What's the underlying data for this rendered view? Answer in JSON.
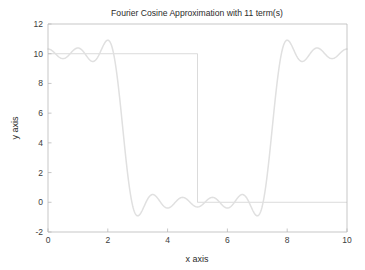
{
  "chart_data": {
    "type": "line",
    "title": "Fourier Cosine Approximation with 11 term(s)",
    "xlabel": "x axis",
    "ylabel": "y axis",
    "xlim": [
      0,
      10
    ],
    "ylim": [
      -2,
      12
    ],
    "xticks": [
      0,
      2,
      4,
      6,
      8,
      10
    ],
    "xtick_labels": [
      "0",
      "2",
      "4",
      "6",
      "8",
      "10"
    ],
    "yticks": [
      -2,
      0,
      2,
      4,
      6,
      8,
      10,
      12
    ],
    "ytick_labels": [
      "-2",
      "0",
      "2",
      "4",
      "6",
      "8",
      "10",
      "12"
    ],
    "grid": false,
    "legend": null,
    "colors": {
      "square_wave": "#d2d2d2",
      "fourier": "#e0e0e0",
      "axis": "#b9b9b9",
      "text": "#2b2b2b",
      "background": "#ffffff"
    },
    "series": [
      {
        "name": "square wave",
        "type": "step",
        "amplitude": 10,
        "baseline": 0,
        "jump_x": 5,
        "x": [
          0,
          5,
          5,
          10
        ],
        "values": [
          10,
          10,
          0,
          0
        ]
      },
      {
        "name": "Fourier cosine approximation",
        "type": "fourier_cosine",
        "n_terms": 11,
        "half_period": 5,
        "mean": 5,
        "amplitude": 10,
        "description": "Truncated cosine series approximating a square wave of height 10 on 0<x<5 and 0 on 5<x<10",
        "x_start": 0,
        "x_end": 10,
        "samples": 600,
        "observed_points": [
          {
            "x": 0.0,
            "y": 11.5
          },
          {
            "x": 0.45,
            "y": 10.0
          },
          {
            "x": 1.05,
            "y": 9.35
          },
          {
            "x": 1.6,
            "y": 10.0
          },
          {
            "x": 2.05,
            "y": 10.45
          },
          {
            "x": 2.5,
            "y": 10.0
          },
          {
            "x": 3.05,
            "y": 9.4
          },
          {
            "x": 3.5,
            "y": 10.0
          },
          {
            "x": 4.0,
            "y": 10.9
          },
          {
            "x": 4.5,
            "y": 9.4
          },
          {
            "x": 5.0,
            "y": 5.0
          },
          {
            "x": 5.5,
            "y": 0.6
          },
          {
            "x": 6.0,
            "y": -0.85
          },
          {
            "x": 6.5,
            "y": 0.0
          },
          {
            "x": 7.0,
            "y": 0.35
          },
          {
            "x": 7.5,
            "y": 0.0
          },
          {
            "x": 8.0,
            "y": -0.4
          },
          {
            "x": 8.6,
            "y": 0.0
          },
          {
            "x": 9.2,
            "y": 0.18
          },
          {
            "x": 10.0,
            "y": -0.25
          }
        ]
      }
    ]
  },
  "figure": {
    "plot_box": {
      "left": 48,
      "top": 24,
      "right": 347,
      "bottom": 232
    }
  }
}
